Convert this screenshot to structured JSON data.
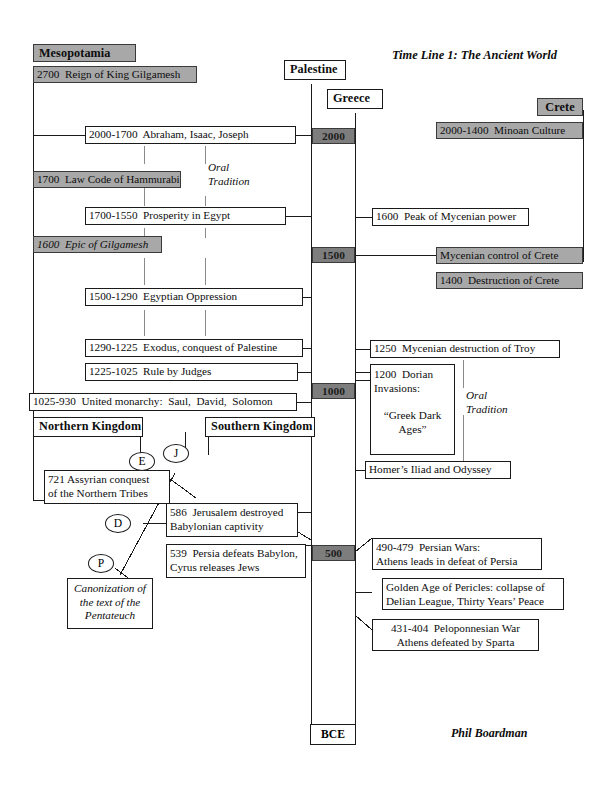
{
  "title": "Time Line 1: The Ancient World",
  "author": "Phil Boardman",
  "colors": {
    "gray_fill": "#a8a8a8",
    "era_fill": "#7d7d7d",
    "line": "#1a1a1a",
    "background": "#ffffff"
  },
  "column_headers": {
    "mesopotamia": "Mesopotamia",
    "palestine": "Palestine",
    "greece": "Greece",
    "crete": "Crete",
    "northern_kingdom": "Northern Kingdom",
    "southern_kingdom": "Southern Kingdom"
  },
  "era_scale": {
    "label_bottom": "BCE",
    "markers": [
      "2000",
      "1500",
      "1000",
      "500"
    ]
  },
  "mesopotamia_events": [
    {
      "id": "gilgamesh-reign",
      "text": "2700  Reign of King Gilgamesh",
      "shaded": true
    },
    {
      "id": "hammurabi",
      "text": "1700  Law Code of Hammurabi",
      "shaded": true
    },
    {
      "id": "epic-gilgamesh",
      "text": "1600  Epic of Gilgamesh",
      "shaded": true,
      "italic_part": "Epic of Gilgamesh"
    }
  ],
  "palestine_events": [
    {
      "id": "patriarchs",
      "text": "2000-1700  Abraham, Isaac, Joseph"
    },
    {
      "id": "prosperity-egypt",
      "text": "1700-1550  Prosperity in Egypt"
    },
    {
      "id": "egyptian-oppression",
      "text": "1500-1290  Egyptian Oppression"
    },
    {
      "id": "exodus",
      "text": "1290-1225  Exodus, conquest of Palestine"
    },
    {
      "id": "judges",
      "text": "1225-1025  Rule by Judges"
    },
    {
      "id": "united-monarchy",
      "text": "1025-930  United monarchy:  Saul,  David,  Solomon"
    }
  ],
  "northern_kingdom_events": [
    {
      "id": "assyrian-conquest",
      "line1": "721 Assyrian conquest",
      "line2": "of the Northern Tribes"
    }
  ],
  "southern_kingdom_events": [
    {
      "id": "jerusalem-destroyed",
      "line1": "586  Jerusalem destroyed",
      "line2": "Babylonian captivity"
    },
    {
      "id": "persia-defeats-babylon",
      "line1": "539  Persia defeats Babylon,",
      "line2": "Cyrus releases Jews"
    }
  ],
  "source_nodes": [
    {
      "id": "node-e",
      "label": "E"
    },
    {
      "id": "node-j",
      "label": "J"
    },
    {
      "id": "node-d",
      "label": "D"
    },
    {
      "id": "node-p",
      "label": "P"
    }
  ],
  "pentateuch_box": {
    "line1": "Canonization of",
    "line2": "the text of the",
    "line3": "Pentateuch"
  },
  "greece_events": [
    {
      "id": "mycenian-peak",
      "text": "1600  Peak of Mycenian power"
    },
    {
      "id": "troy-destruction",
      "text": "1250  Mycenian destruction of Troy"
    },
    {
      "id": "dorian-invasions",
      "line1": "1200  Dorian",
      "line2": "Invasions:",
      "line3": "“Greek Dark",
      "line4": "Ages”"
    },
    {
      "id": "homer",
      "text": "Homer’s Iliad and Odyssey",
      "italic_parts": [
        "Iliad",
        "Odyssey"
      ]
    },
    {
      "id": "persian-wars",
      "line1": "490-479  Persian Wars:",
      "line2": "Athens leads in defeat of Persia"
    },
    {
      "id": "pericles",
      "line1": "Golden Age of Pericles: collapse of",
      "line2": "Delian League, Thirty Years’ Peace"
    },
    {
      "id": "peloponnesian-war",
      "line1": "431-404  Peloponnesian War",
      "line2": "Athens defeated by Sparta"
    }
  ],
  "crete_events": [
    {
      "id": "minoan-culture",
      "text": "2000-1400  Minoan Culture",
      "shaded": true
    },
    {
      "id": "mycenian-control",
      "text": "Mycenian control of Crete",
      "shaded": true
    },
    {
      "id": "crete-destruction",
      "text": "1400  Destruction of Crete",
      "shaded": true
    }
  ],
  "annotations": [
    {
      "id": "oral-tradition-palestine",
      "line1": "Oral",
      "line2": "Tradition"
    },
    {
      "id": "oral-tradition-greece",
      "line1": "Oral",
      "line2": "Tradition"
    }
  ]
}
